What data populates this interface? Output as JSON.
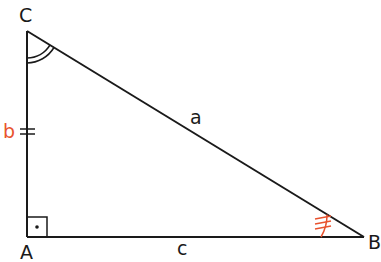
{
  "diagram": {
    "type": "right-triangle",
    "vertices": {
      "A": {
        "label": "A",
        "x": 27,
        "y": 237
      },
      "B": {
        "label": "B",
        "x": 364,
        "y": 237
      },
      "C": {
        "label": "C",
        "x": 27,
        "y": 31
      }
    },
    "sides": {
      "a": {
        "label": "a",
        "from": "B",
        "to": "C",
        "color": "#1a1a1a"
      },
      "b": {
        "label": "b",
        "from": "A",
        "to": "C",
        "color": "#e8532f",
        "tick_marks": 2
      },
      "c": {
        "label": "c",
        "from": "A",
        "to": "B",
        "color": "#1a1a1a"
      }
    },
    "angles": {
      "A": {
        "mark": "right-angle-box-with-dot"
      },
      "B": {
        "mark": "single-arc-with-3-ticks",
        "color": "#e8532f"
      },
      "C": {
        "mark": "double-arc",
        "color": "#1a1a1a"
      }
    },
    "colors": {
      "line": "#1a1a1a",
      "accent": "#e8532f"
    }
  }
}
